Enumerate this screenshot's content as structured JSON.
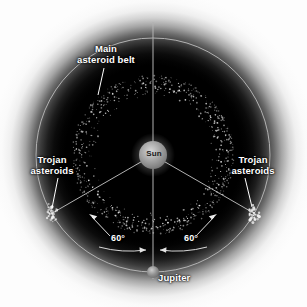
{
  "figure": {
    "background_color": "#000000",
    "line_color": "#b9b9b9",
    "label_color": "#ffffff",
    "asteroid_color": "#e8e8e8"
  },
  "labels": {
    "main_belt": "Main\nasteroid belt",
    "main_belt_line1": "Main",
    "main_belt_line2": "asteroid belt",
    "trojan_left_line1": "Trojan",
    "trojan_left_line2": "asteroids",
    "trojan_right_line1": "Trojan",
    "trojan_right_line2": "asteroids",
    "sun": "Sun",
    "jupiter": "Jupiter",
    "angle_left": "60°",
    "angle_right": "60°"
  },
  "chart_data": {
    "type": "scatter",
    "center": {
      "x": 153,
      "y": 155,
      "name": "Sun"
    },
    "bodies": [
      {
        "name": "Sun",
        "x": 153,
        "y": 155,
        "radius_px": 14,
        "color": "#9a9a9a"
      },
      {
        "name": "Jupiter",
        "x": 153,
        "y": 272,
        "radius_px": 6,
        "color": "#8f8f8f"
      }
    ],
    "orbits": [
      {
        "name": "jupiter-orbit",
        "radius_px": 117,
        "color": "#b0b0b0"
      }
    ],
    "belts": [
      {
        "name": "main-asteroid-belt",
        "inner_radius_px": 57,
        "outer_radius_px": 81,
        "point_count": 760
      }
    ],
    "swarms": [
      {
        "name": "trojan-leading",
        "angle_deg": 60,
        "radius_px": 117,
        "x": 52,
        "y": 213
      },
      {
        "name": "trojan-trailing",
        "angle_deg": -60,
        "radius_px": 117,
        "x": 254,
        "y": 213
      }
    ],
    "angles": [
      {
        "label": "60°",
        "from": "Jupiter",
        "to": "trojan-leading",
        "value": 60
      },
      {
        "label": "60°",
        "from": "Jupiter",
        "to": "trojan-trailing",
        "value": 60
      }
    ],
    "radial_lines": [
      {
        "from": "Sun",
        "to": "top",
        "angle_deg": 90
      },
      {
        "from": "Sun",
        "to": "Jupiter",
        "angle_deg": 270
      },
      {
        "from": "Sun",
        "to": "trojan-leading",
        "angle_deg": 210
      },
      {
        "from": "Sun",
        "to": "trojan-trailing",
        "angle_deg": 330
      }
    ],
    "xlabel": "",
    "ylabel": "",
    "grid": false,
    "legend": "none"
  }
}
